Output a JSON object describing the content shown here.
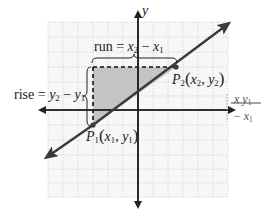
{
  "diagram": {
    "axes": {
      "x_label": "x",
      "y_label": "y"
    },
    "points": [
      {
        "name": "P1",
        "letter": "P",
        "sub": "1",
        "coords_text": "(x1, y1)",
        "x_var": "x",
        "x_sub": "1",
        "y_var": "y",
        "y_sub": "1"
      },
      {
        "name": "P2",
        "letter": "P",
        "sub": "2",
        "coords_text": "(x2, y2)",
        "x_var": "x",
        "x_sub": "2",
        "y_var": "y",
        "y_sub": "2"
      }
    ],
    "run_label": {
      "word": "run",
      "eq": "=",
      "a": "x",
      "a_sub": "2",
      "minus": "−",
      "b": "x",
      "b_sub": "1"
    },
    "rise_label": {
      "word": "rise",
      "eq": "=",
      "a": "y",
      "a_sub": "2",
      "minus": "−",
      "b": "y",
      "b_sub": "1"
    },
    "right_fragment": {
      "top_a": "x",
      "top_b": "y",
      "top_b_sub": "1",
      "bottom_minus": "−",
      "bottom_b": "x",
      "bottom_b_sub": "1"
    },
    "colors": {
      "grid": "#d4d4d4",
      "grid_bg": "#f7f7f7",
      "axis": "#222222",
      "line": "#3a3a3a",
      "shade": "#c8c8c8",
      "dash": "#111111"
    }
  }
}
